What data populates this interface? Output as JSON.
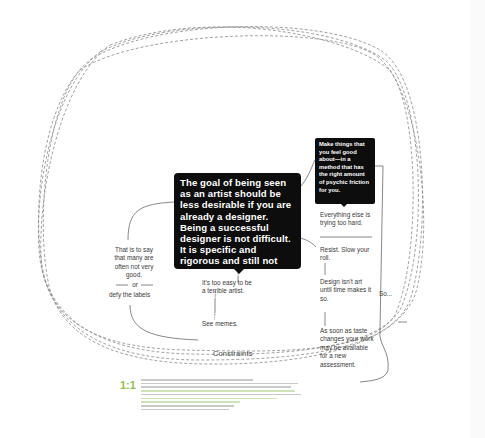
{
  "diagram": {
    "main_box": {
      "text": "The goal of being seen as an artist should be less desirable if you are already a designer. Being a successful designer is not difficult. It is specific and rigorous and still not difficult. Becoming a successful artist is more difficult to measure since it is largely subjective."
    },
    "side_box": {
      "text": "Make things that you feel good about—in a method that has the right amount of psychic friction for you."
    },
    "notes": {
      "everything_else": "Everything else is trying too hard.",
      "resist": "Resist. Slow your roll.",
      "design_isnt_art": "Design isn't art until time makes it so.",
      "taste_changes": "As soon as taste changes your work may be available for a new assessment.",
      "so": "So...",
      "that_is_to_say": "That is to say that many are often not very good.",
      "or": "or",
      "defy_labels": "defy the labels",
      "too_easy": "It's too easy to be a terrible artist.",
      "see_memes": "See memes."
    },
    "loop_label": "Constraints",
    "colors": {
      "box_fill": "#0d0d0d",
      "box_text": "#ffffff",
      "line": "#555555",
      "dashed_loop": "#8a8a8a",
      "accent_green": "#8fc24d"
    }
  },
  "caption": {
    "ratio_label": "1:1",
    "line_count": 10
  }
}
